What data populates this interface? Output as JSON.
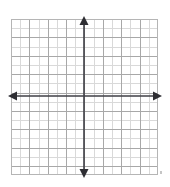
{
  "figure": {
    "name": "cartesian-coordinate-grid",
    "title": "",
    "background_color": "#ffffff"
  },
  "chart_data": {
    "type": "scatter",
    "title": "",
    "subtitle": "",
    "xlabel": "",
    "ylabel": "",
    "series": [],
    "x": [],
    "values": [],
    "categories": [],
    "annotations": [],
    "legend": {
      "entries": [],
      "position": "none",
      "visible": false
    },
    "grid": {
      "visible": true,
      "minor_color": "#d9d9d9",
      "major_color": "#a8a8a8",
      "minor_step": 1,
      "major_step": 2,
      "cell_size_px": 9.1875,
      "columns": 16,
      "rows": 17,
      "border_color": "#b5b5b5"
    },
    "axes": {
      "color": "#3f3f46",
      "line_width_px": 2,
      "arrowheads": [
        "left",
        "right",
        "up",
        "down"
      ],
      "x_axis_visible": true,
      "y_axis_visible": true,
      "origin_px": {
        "x": 84,
        "y": 96
      },
      "tick_labels_visible": false,
      "x_tick_labels": [],
      "y_tick_labels": []
    },
    "xlim": [
      -9,
      7
    ],
    "ylim": [
      -8,
      9
    ]
  },
  "icons": {
    "arrow_up": "arrow-up-icon",
    "arrow_down": "arrow-down-icon",
    "arrow_left": "arrow-left-icon",
    "arrow_right": "arrow-right-icon"
  }
}
